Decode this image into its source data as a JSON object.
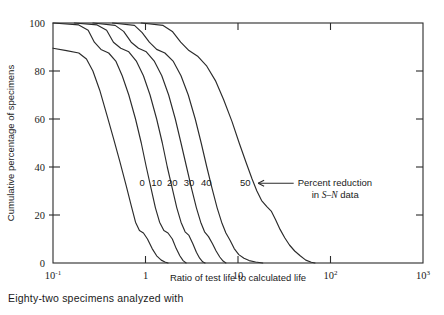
{
  "caption": "Eighty-two specimens analyzed with",
  "colors": {
    "ink": "#2b2b2b",
    "background": "#ffffff"
  },
  "chart_data": {
    "type": "line",
    "title": "",
    "xlabel": "Ratio of test life to calculated life",
    "ylabel": "Cumulative percentage of specimens",
    "xscale": "log",
    "xlim": [
      0.1,
      1000
    ],
    "ylim": [
      0,
      100
    ],
    "grid": false,
    "legend_position": "inline-curve-labels",
    "x_ticks": [
      {
        "value": 0.1,
        "label": "10",
        "exp": "-1"
      },
      {
        "value": 1,
        "label": "1",
        "exp": ""
      },
      {
        "value": 10,
        "label": "10",
        "exp": ""
      },
      {
        "value": 100,
        "label": "10",
        "exp": "2"
      },
      {
        "value": 1000,
        "label": "10",
        "exp": "3"
      }
    ],
    "y_ticks": [
      0,
      20,
      40,
      60,
      80,
      100
    ],
    "annotation": {
      "arrow": "←",
      "line1": "Percent reduction",
      "line2_pre": "in ",
      "line2_italic": "S–N",
      "line2_post": " data"
    },
    "series": [
      {
        "name": "0",
        "label": "0",
        "label_x": 0.92,
        "label_y": 32,
        "points": [
          [
            0.1,
            89.5
          ],
          [
            0.14,
            88.5
          ],
          [
            0.19,
            87.5
          ],
          [
            0.23,
            85.0
          ],
          [
            0.27,
            80.0
          ],
          [
            0.32,
            72.0
          ],
          [
            0.38,
            62.0
          ],
          [
            0.45,
            52.0
          ],
          [
            0.53,
            42.0
          ],
          [
            0.62,
            32.0
          ],
          [
            0.7,
            24.0
          ],
          [
            0.78,
            17.0
          ],
          [
            0.86,
            13.5
          ],
          [
            0.95,
            12.5
          ],
          [
            1.05,
            10.0
          ],
          [
            1.18,
            6.0
          ],
          [
            1.32,
            3.0
          ],
          [
            1.48,
            1.2
          ],
          [
            1.62,
            0.4
          ],
          [
            1.75,
            0.0
          ]
        ]
      },
      {
        "name": "10",
        "label": "10",
        "label_x": 1.32,
        "label_y": 32,
        "points": [
          [
            0.1,
            100.0
          ],
          [
            0.19,
            99.2
          ],
          [
            0.24,
            97.0
          ],
          [
            0.28,
            92.0
          ],
          [
            0.33,
            89.0
          ],
          [
            0.4,
            87.5
          ],
          [
            0.48,
            84.0
          ],
          [
            0.56,
            78.0
          ],
          [
            0.66,
            70.0
          ],
          [
            0.78,
            60.0
          ],
          [
            0.9,
            50.0
          ],
          [
            1.02,
            40.0
          ],
          [
            1.15,
            31.0
          ],
          [
            1.28,
            23.0
          ],
          [
            1.42,
            17.0
          ],
          [
            1.58,
            13.5
          ],
          [
            1.75,
            12.5
          ],
          [
            1.95,
            10.0
          ],
          [
            2.15,
            6.0
          ],
          [
            2.35,
            3.0
          ],
          [
            2.55,
            1.0
          ],
          [
            2.75,
            0.0
          ]
        ]
      },
      {
        "name": "20",
        "label": "20",
        "label_x": 1.95,
        "label_y": 32,
        "points": [
          [
            0.17,
            100.0
          ],
          [
            0.3,
            99.2
          ],
          [
            0.38,
            97.0
          ],
          [
            0.45,
            92.0
          ],
          [
            0.54,
            89.5
          ],
          [
            0.66,
            88.0
          ],
          [
            0.8,
            84.0
          ],
          [
            0.95,
            78.0
          ],
          [
            1.12,
            70.0
          ],
          [
            1.32,
            60.0
          ],
          [
            1.52,
            50.0
          ],
          [
            1.72,
            40.0
          ],
          [
            1.95,
            31.0
          ],
          [
            2.18,
            23.0
          ],
          [
            2.42,
            17.0
          ],
          [
            2.68,
            13.0
          ],
          [
            2.95,
            11.5
          ],
          [
            3.25,
            8.0
          ],
          [
            3.55,
            4.5
          ],
          [
            3.85,
            2.0
          ],
          [
            4.15,
            0.5
          ],
          [
            4.4,
            0.0
          ]
        ]
      },
      {
        "name": "30",
        "label": "30",
        "label_x": 2.95,
        "label_y": 32,
        "points": [
          [
            0.27,
            100.0
          ],
          [
            0.47,
            99.0
          ],
          [
            0.58,
            96.5
          ],
          [
            0.7,
            92.0
          ],
          [
            0.84,
            89.5
          ],
          [
            1.02,
            88.0
          ],
          [
            1.25,
            84.0
          ],
          [
            1.5,
            78.0
          ],
          [
            1.78,
            70.0
          ],
          [
            2.1,
            60.0
          ],
          [
            2.42,
            50.0
          ],
          [
            2.78,
            40.0
          ],
          [
            3.15,
            31.0
          ],
          [
            3.55,
            23.0
          ],
          [
            3.95,
            17.0
          ],
          [
            4.35,
            13.0
          ],
          [
            4.8,
            11.0
          ],
          [
            5.3,
            8.0
          ],
          [
            5.8,
            5.0
          ],
          [
            6.35,
            2.5
          ],
          [
            6.9,
            0.8
          ],
          [
            7.4,
            0.0
          ]
        ]
      },
      {
        "name": "40",
        "label": "40",
        "label_x": 4.55,
        "label_y": 32,
        "points": [
          [
            0.44,
            100.0
          ],
          [
            0.76,
            99.0
          ],
          [
            0.92,
            96.0
          ],
          [
            1.1,
            92.0
          ],
          [
            1.32,
            89.0
          ],
          [
            1.62,
            87.5
          ],
          [
            2.0,
            84.0
          ],
          [
            2.42,
            78.0
          ],
          [
            2.9,
            70.0
          ],
          [
            3.45,
            60.0
          ],
          [
            4.0,
            50.0
          ],
          [
            4.6,
            40.0
          ],
          [
            5.25,
            31.0
          ],
          [
            5.95,
            23.0
          ],
          [
            6.65,
            17.0
          ],
          [
            7.4,
            12.5
          ],
          [
            8.2,
            9.5
          ],
          [
            9.1,
            6.0
          ],
          [
            10.2,
            3.5
          ],
          [
            11.6,
            2.0
          ],
          [
            13.2,
            1.0
          ],
          [
            15.5,
            0.4
          ],
          [
            18.5,
            0.0
          ]
        ]
      },
      {
        "name": "50",
        "label": "50",
        "label_x": 12.0,
        "label_y": 32,
        "points": [
          [
            0.9,
            100.0
          ],
          [
            1.55,
            99.0
          ],
          [
            1.95,
            96.5
          ],
          [
            2.4,
            92.0
          ],
          [
            2.95,
            88.5
          ],
          [
            3.7,
            86.0
          ],
          [
            4.6,
            82.0
          ],
          [
            5.7,
            76.0
          ],
          [
            7.0,
            68.0
          ],
          [
            8.6,
            59.0
          ],
          [
            10.3,
            50.0
          ],
          [
            12.2,
            42.0
          ],
          [
            14.2,
            35.0
          ],
          [
            16.0,
            30.0
          ],
          [
            18.0,
            26.0
          ],
          [
            20.5,
            23.5
          ],
          [
            23.0,
            21.5
          ],
          [
            25.5,
            18.0
          ],
          [
            28.5,
            14.0
          ],
          [
            32.0,
            10.5
          ],
          [
            36.0,
            7.5
          ],
          [
            41.0,
            5.0
          ],
          [
            47.0,
            3.0
          ],
          [
            54.0,
            1.2
          ],
          [
            62.0,
            0.3
          ],
          [
            68.0,
            0.0
          ]
        ]
      }
    ]
  }
}
